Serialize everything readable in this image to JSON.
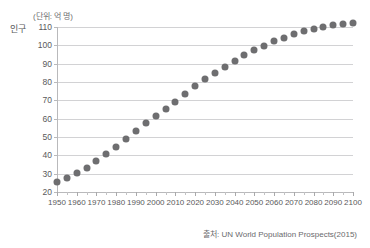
{
  "chart_data": {
    "type": "scatter",
    "title": "",
    "subtitle": "",
    "ylabel": "인구",
    "unit_note": "(단위: 억 명)",
    "xlabel": "",
    "source": "출처: UN World Population Prospects(2015)",
    "xlim": [
      1950,
      2100
    ],
    "ylim": [
      20,
      110
    ],
    "yticks": [
      20,
      30,
      40,
      50,
      60,
      70,
      80,
      90,
      100,
      110
    ],
    "xticks": [
      1950,
      1960,
      1970,
      1980,
      1990,
      2000,
      2010,
      2020,
      2030,
      2040,
      2050,
      2060,
      2070,
      2080,
      2090,
      2100
    ],
    "x_minor_step": 5,
    "grid": "horizontal",
    "legend": "none",
    "marker_color": "#6e6e70",
    "grid_color": "#d2d2d4",
    "axis_color": "#b9b9bb",
    "series": [
      {
        "name": "세계 인구",
        "x": [
          1950,
          1955,
          1960,
          1965,
          1970,
          1975,
          1980,
          1985,
          1990,
          1995,
          2000,
          2005,
          2010,
          2015,
          2020,
          2025,
          2030,
          2035,
          2040,
          2045,
          2050,
          2055,
          2060,
          2065,
          2070,
          2075,
          2080,
          2085,
          2090,
          2095,
          2100
        ],
        "values": [
          25.3,
          27.7,
          30.3,
          33.3,
          36.8,
          40.6,
          44.6,
          48.7,
          53.3,
          57.4,
          61.3,
          65.2,
          69.2,
          73.5,
          77.6,
          81.4,
          85.0,
          88.3,
          91.6,
          94.5,
          97.3,
          99.8,
          102.2,
          104.2,
          106.0,
          107.6,
          109.0,
          110.1,
          111.0,
          111.6,
          112.1
        ]
      }
    ]
  }
}
